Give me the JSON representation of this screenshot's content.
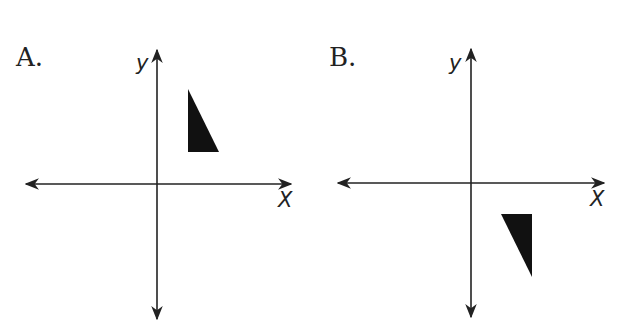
{
  "panels": [
    {
      "label": "A.",
      "x_axis_label": "X",
      "y_axis_label": "y",
      "triangle_quadrant": "I",
      "triangle_orientation": "right angle at bottom-left; hypotenuse slopes down to the right"
    },
    {
      "label": "B.",
      "x_axis_label": "X",
      "y_axis_label": "y",
      "triangle_quadrant": "IV",
      "triangle_orientation": "right angle at top-right; hypotenuse slopes down to the right"
    }
  ],
  "colors": {
    "ink": "#222222",
    "fill": "#111111",
    "background": "#ffffff"
  }
}
